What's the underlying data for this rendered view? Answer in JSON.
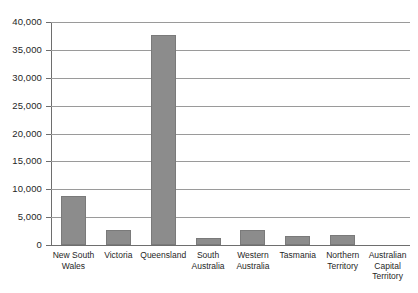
{
  "chart_data": {
    "type": "bar",
    "title": "",
    "subtitle": "",
    "xlabel": "",
    "ylabel": "",
    "categories": [
      "New South Wales",
      "Victoria",
      "Queensland",
      "South Australia",
      "Western Australia",
      "Tasmania",
      "Northern Territory",
      "Australian Capital Territory"
    ],
    "values": [
      8800,
      2700,
      37600,
      1200,
      2700,
      1700,
      1800,
      0
    ],
    "ylim": [
      0,
      40000
    ],
    "ytick_values": [
      0,
      5000,
      10000,
      15000,
      20000,
      25000,
      30000,
      35000,
      40000
    ],
    "ytick_labels": [
      "0",
      "5,000",
      "10,000",
      "15,000",
      "20,000",
      "25,000",
      "30,000",
      "35,000",
      "40,000"
    ],
    "grid": true,
    "legend": false,
    "legend_position": "none",
    "bar_color": "#8c8c8c",
    "bar_border_color": "#7a7a7a",
    "gridline_color": "#9a9a9a",
    "axis_color": "#6e6e6e"
  }
}
